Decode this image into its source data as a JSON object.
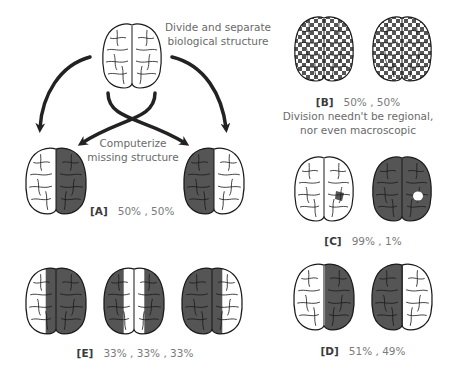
{
  "colors": {
    "background": "#ffffff",
    "brain_outline": "#1a1a1a",
    "brain_fill_light": "#ffffff",
    "brain_fill_dark": "#555555",
    "arrow": "#222222",
    "caption_text": "#6a6a6a",
    "label_text": "#3a3a3a"
  },
  "top": {
    "caption_line1": "Divide and separate",
    "caption_line2": "biological structure",
    "center_caption_line1": "Computerize",
    "center_caption_line2": "missing structure"
  },
  "panels": {
    "A": {
      "label": "[A]",
      "percent": "50% , 50%",
      "brains": [
        "left-white-right-dark",
        "left-dark-right-white"
      ]
    },
    "B": {
      "label": "[B]",
      "percent": "50% , 50%",
      "note_line1": "Division needn't be regional,",
      "note_line2": "nor even macroscopic",
      "brains": [
        "checkerboard",
        "checkerboard-inverse"
      ]
    },
    "C": {
      "label": "[C]",
      "percent": "99% , 1%",
      "brains": [
        "white-with-dark-spot",
        "dark-with-white-spot"
      ]
    },
    "D": {
      "label": "[D]",
      "percent": "51% , 49%",
      "brains": [
        "left-white-right-dark",
        "left-dark-right-white"
      ]
    },
    "E": {
      "label": "[E]",
      "percent": "33% , 33% , 33%",
      "brains": [
        "left-third-white",
        "middle-third-white",
        "right-third-white"
      ]
    }
  }
}
